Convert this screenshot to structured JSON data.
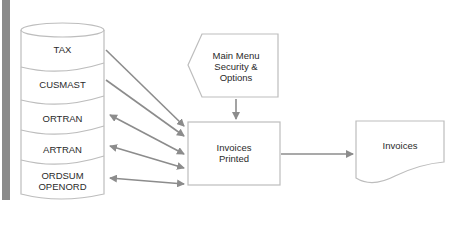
{
  "diagram": {
    "database_segments": [
      {
        "label": "TAX",
        "line2": "",
        "direction": "to-process"
      },
      {
        "label": "CUSMAST",
        "line2": "",
        "direction": "to-process"
      },
      {
        "label": "ORTRAN",
        "line2": "",
        "direction": "bidirectional"
      },
      {
        "label": "ARTRAN",
        "line2": "",
        "direction": "bidirectional"
      },
      {
        "label": "ORDSUM",
        "line2": "OPENORD",
        "direction": "bidirectional"
      }
    ],
    "input_shape": {
      "line1": "Main Menu",
      "line2": "Security &",
      "line3": "Options"
    },
    "process": {
      "line1": "Invoices",
      "line2": "Printed"
    },
    "output_document": {
      "label": "Invoices"
    },
    "colors": {
      "stroke": "#bdbdbd",
      "arrow": "#8c8c8c",
      "sidebar": "#8a8a8a",
      "text": "#2a2a2a"
    }
  }
}
